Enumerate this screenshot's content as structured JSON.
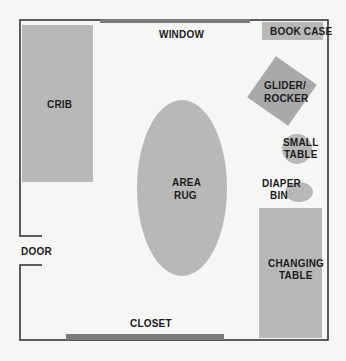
{
  "colors": {
    "background": "#f6f6f4",
    "furniture": "#b8b8b8",
    "fixture_bar": "#7a7a7a",
    "wall": "#2a2a2a",
    "text": "#1c1c1c"
  },
  "labels": {
    "window": "WINDOW",
    "book_case": "BOOK CASE",
    "crib": "CRIB",
    "glider_line1": "GLIDER/",
    "glider_line2": "ROCKER",
    "small_table_line1": "SMALL",
    "small_table_line2": "TABLE",
    "area_rug_line1": "AREA",
    "area_rug_line2": "RUG",
    "diaper_bin_line1": "DIAPER",
    "diaper_bin_line2": "BIN",
    "door": "DOOR",
    "changing_table_line1": "CHANGING",
    "changing_table_line2": "TABLE",
    "closet": "CLOSET"
  }
}
